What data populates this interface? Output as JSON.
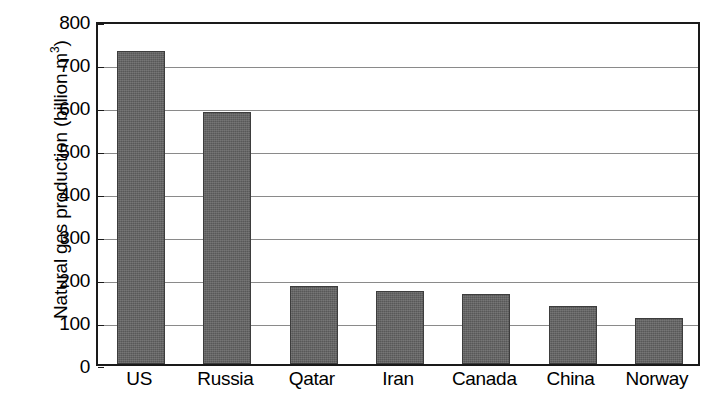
{
  "chart_data": {
    "type": "bar",
    "title": "",
    "subtitle": "",
    "xlabel": "",
    "ylabel": "Natural gas production (billion m",
    "ylabel_superscript": "3",
    "ylabel_suffix": ")",
    "ylabel_full": "Natural gas production (billion m3)",
    "categories": [
      "US",
      "Russia",
      "Qatar",
      "Iran",
      "Canada",
      "China",
      "Norway"
    ],
    "values": [
      728,
      586,
      181,
      170,
      162,
      134,
      108
    ],
    "ylim": [
      0,
      800
    ],
    "ytick_step": 100,
    "yticks": [
      0,
      100,
      200,
      300,
      400,
      500,
      600,
      700,
      800
    ],
    "ytick_labels": [
      "0",
      "100",
      "200",
      "300",
      "400",
      "500",
      "600",
      "700",
      "800"
    ],
    "grid": "horizontal",
    "legend": "none",
    "bar_color": "#616161",
    "bar_edge_color": "#3d3d3d",
    "axis_color": "#1a1a1a",
    "grid_color": "#8a8a8a",
    "background_color": "#ffffff"
  }
}
